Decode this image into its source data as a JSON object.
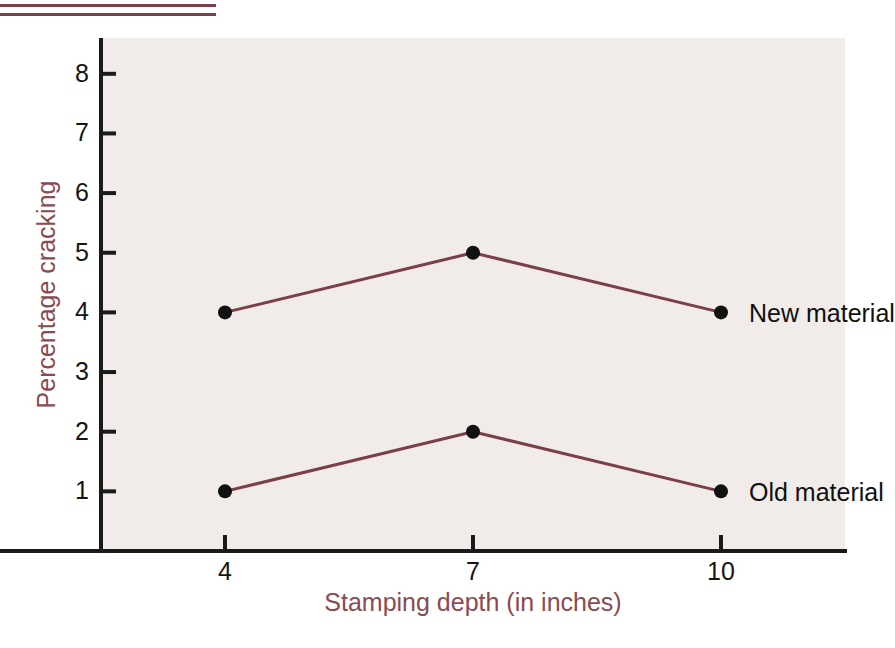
{
  "figure": {
    "background_color": "#ffffff",
    "plot_background_color": "#f1ecea",
    "accent_color": "#8a4a52",
    "rule_color": "#7d4048",
    "series_color": "#7d3f47",
    "marker_color": "#111111",
    "axis_color": "#1a1a1a",
    "rule_top_label": "decorative-rule",
    "rule_bottom_label": "decorative-rule"
  },
  "chart_data": {
    "type": "line",
    "title": "",
    "xlabel": "Stamping depth (in inches)",
    "ylabel": "Percentage cracking",
    "x": [
      4,
      7,
      10
    ],
    "xticks": [
      "4",
      "7",
      "10"
    ],
    "yticks": [
      "1",
      "2",
      "3",
      "4",
      "5",
      "6",
      "7",
      "8"
    ],
    "xlim": [
      2.5,
      11.5
    ],
    "ylim": [
      0,
      8.6
    ],
    "grid": false,
    "legend_position": "inline-right",
    "series": [
      {
        "name": "New material",
        "values": [
          4,
          5,
          4
        ],
        "color": "#7d3f47",
        "marker": "filled-circle"
      },
      {
        "name": "Old material",
        "values": [
          1,
          2,
          1
        ],
        "color": "#7d3f47",
        "marker": "filled-circle"
      }
    ],
    "annotations": [
      {
        "text": "New material",
        "x": 10,
        "y": 4
      },
      {
        "text": "Old material",
        "x": 10,
        "y": 1
      }
    ]
  }
}
